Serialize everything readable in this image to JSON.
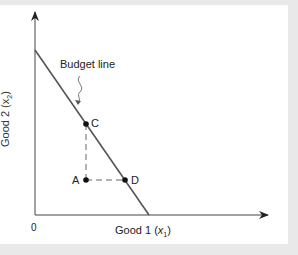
{
  "diagram": {
    "x_axis": {
      "label": "Good 1 (",
      "var": "x",
      "sub": "1",
      "close": ")"
    },
    "y_axis": {
      "label": "Good 2 (",
      "var": "x",
      "sub": "2",
      "close": ")"
    },
    "origin": "0",
    "budget_line_label": "Budget line",
    "points": [
      {
        "name": "C",
        "position": "on budget line"
      },
      {
        "name": "A",
        "position": "inside budget set"
      },
      {
        "name": "D",
        "position": "on budget line"
      }
    ],
    "colors": {
      "line": "#555555",
      "axis": "#333333",
      "background": "#e9e9e9",
      "panel": "#ffffff"
    }
  }
}
